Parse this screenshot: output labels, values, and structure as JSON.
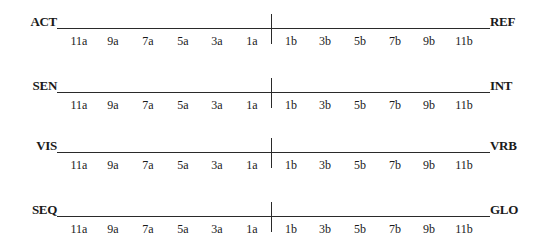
{
  "diagram": {
    "type": "bipolar-scales",
    "scales": [
      {
        "left_label": "ACT",
        "right_label": "REF",
        "ticks_left": [
          "11a",
          "9a",
          "7a",
          "5a",
          "3a",
          "1a"
        ],
        "ticks_right": [
          "1b",
          "3b",
          "5b",
          "7b",
          "9b",
          "11b"
        ]
      },
      {
        "left_label": "SEN",
        "right_label": "INT",
        "ticks_left": [
          "11a",
          "9a",
          "7a",
          "5a",
          "3a",
          "1a"
        ],
        "ticks_right": [
          "1b",
          "3b",
          "5b",
          "7b",
          "9b",
          "11b"
        ]
      },
      {
        "left_label": "VIS",
        "right_label": "VRB",
        "ticks_left": [
          "11a",
          "9a",
          "7a",
          "5a",
          "3a",
          "1a"
        ],
        "ticks_right": [
          "1b",
          "3b",
          "5b",
          "7b",
          "9b",
          "11b"
        ]
      },
      {
        "left_label": "SEQ",
        "right_label": "GLO",
        "ticks_left": [
          "11a",
          "9a",
          "7a",
          "5a",
          "3a",
          "1a"
        ],
        "ticks_right": [
          "1b",
          "3b",
          "5b",
          "7b",
          "9b",
          "11b"
        ]
      }
    ]
  },
  "colors": {
    "background": "#ffffff",
    "ink": "#1a1a1a"
  }
}
